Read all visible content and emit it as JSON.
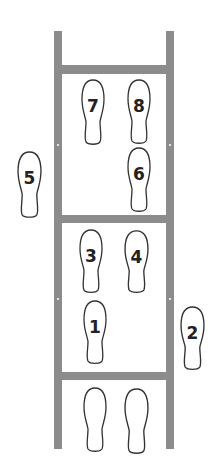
{
  "diagram": {
    "title": "",
    "type": "agility ladder footwork pattern",
    "colors": {
      "ladder": "#8c8c8c",
      "footprint_outline": "#333333",
      "label": "#222222",
      "background": "#ffffff"
    },
    "ladder": {
      "rails": [
        {
          "side": "left",
          "x": 54,
          "y": 31,
          "w": 8,
          "h": 418
        },
        {
          "side": "right",
          "x": 166,
          "y": 31,
          "w": 8,
          "h": 418
        }
      ],
      "rungs": [
        {
          "x": 54,
          "y": 65,
          "w": 120,
          "h": 9
        },
        {
          "x": 54,
          "y": 215,
          "w": 120,
          "h": 8
        },
        {
          "x": 54,
          "y": 372,
          "w": 120,
          "h": 8
        }
      ]
    },
    "footprints": [
      {
        "label": "7",
        "step": 7,
        "x": 81,
        "y": 79,
        "w": 24,
        "h": 67
      },
      {
        "label": "8",
        "step": 8,
        "x": 127,
        "y": 79,
        "w": 24,
        "h": 66
      },
      {
        "label": "5",
        "step": 5,
        "x": 17,
        "y": 151,
        "w": 25,
        "h": 68
      },
      {
        "label": "6",
        "step": 6,
        "x": 127,
        "y": 147,
        "w": 24,
        "h": 66
      },
      {
        "label": "3",
        "step": 3,
        "x": 79,
        "y": 229,
        "w": 24,
        "h": 65
      },
      {
        "label": "4",
        "step": 4,
        "x": 124,
        "y": 230,
        "w": 25,
        "h": 64
      },
      {
        "label": "1",
        "step": 1,
        "x": 83,
        "y": 300,
        "w": 24,
        "h": 65
      },
      {
        "label": "2",
        "step": 2,
        "x": 180,
        "y": 306,
        "w": 25,
        "h": 65
      },
      {
        "label": "",
        "step": null,
        "x": 83,
        "y": 387,
        "w": 24,
        "h": 66
      },
      {
        "label": "",
        "step": null,
        "x": 124,
        "y": 388,
        "w": 25,
        "h": 67
      }
    ]
  }
}
